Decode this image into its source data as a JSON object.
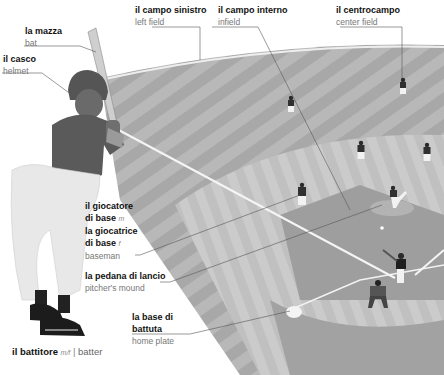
{
  "labels": {
    "bat": {
      "it": "la mazza",
      "en": "bat"
    },
    "helmet": {
      "it": "il casco",
      "en": "helmet"
    },
    "left_field": {
      "it": "il campo sinistro",
      "en": "left field"
    },
    "infield": {
      "it": "il campo interno",
      "en": "infield"
    },
    "center_field": {
      "it": "il centrocampo",
      "en": "center field"
    },
    "baseman": {
      "it_line1": "il giocatore",
      "it_line2": "di base",
      "gender_m": "m",
      "it_line3": "la giocatrice",
      "it_line4": "di base",
      "gender_f": "f",
      "en": "baseman"
    },
    "pitchers_mound": {
      "it": "la pedana di lancio",
      "en": "pitcher's mound"
    },
    "home_plate": {
      "it_line1": "la base di",
      "it_line2": "battuta",
      "en": "home plate"
    }
  },
  "caption": {
    "it": "il battitore",
    "gender": "m/f",
    "separator": "|",
    "en": "batter"
  },
  "colors": {
    "background": "#ffffff",
    "outfield_light": "#b9b9b9",
    "outfield_dark": "#a6a6a6",
    "infield_grass": "#c4c4c4",
    "dirt": "#9c9c9c",
    "leader_line": "#444444"
  }
}
